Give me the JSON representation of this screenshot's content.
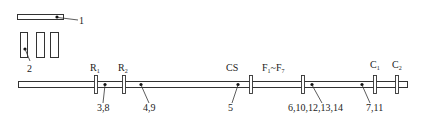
{
  "diagram": {
    "components": {
      "top_bar": {
        "callout": "1"
      },
      "boxes": {
        "count": 3,
        "callout": "2"
      },
      "main_rail": {
        "flanges": [
          {
            "id": "R1",
            "label_main": "R",
            "label_sub": "1"
          },
          {
            "id": "R2",
            "label_main": "R",
            "label_sub": "2"
          },
          {
            "id": "CS",
            "label_main": "CS",
            "label_sub": ""
          },
          {
            "id": "F",
            "label_main": "F",
            "label_sub": "1",
            "label_tilde": "~F",
            "label_sub2": "7"
          },
          {
            "id": "C1",
            "label_main": "C",
            "label_sub": "1"
          },
          {
            "id": "C2",
            "label_main": "C",
            "label_sub": "2"
          }
        ],
        "points": [
          {
            "callout": "3,8"
          },
          {
            "callout": "4,9"
          },
          {
            "callout": "5"
          },
          {
            "callout": "6,10,12,13,14"
          },
          {
            "callout": "7,11"
          }
        ]
      }
    },
    "colors": {
      "stroke": "#333333",
      "background": "#ffffff"
    }
  }
}
